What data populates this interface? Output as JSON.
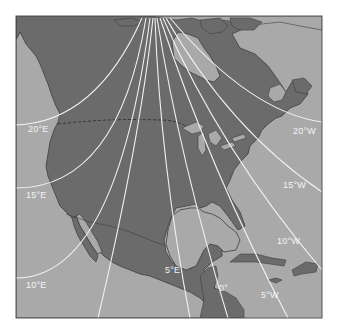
{
  "map": {
    "title": "Magnetic declination isogonic lines — North America",
    "colors": {
      "land": "#6b6b6b",
      "water": "#a9a9a9",
      "isogonic_line": "#f2f2f2",
      "coastline": "#3e3e3e",
      "border_dashed": "#2e2e2e",
      "frame": "#555555",
      "label": "#f4f4f4"
    },
    "labels": [
      {
        "id": "20E",
        "text": "20°E",
        "x": 28,
        "y": 124
      },
      {
        "id": "15E",
        "text": "15°E",
        "x": 26,
        "y": 189
      },
      {
        "id": "10E",
        "text": "10°E",
        "x": 26,
        "y": 282
      },
      {
        "id": "5E",
        "text": "5°E",
        "x": 165,
        "y": 265
      },
      {
        "id": "0",
        "text": "0°",
        "x": 219,
        "y": 283
      },
      {
        "id": "5W",
        "text": "5°W",
        "x": 261,
        "y": 289
      },
      {
        "id": "10W",
        "text": "10°W",
        "x": 277,
        "y": 236
      },
      {
        "id": "15W",
        "text": "15°W",
        "x": 283,
        "y": 181
      },
      {
        "id": "20W",
        "text": "20°W",
        "x": 293,
        "y": 127
      }
    ],
    "features": {
      "regions": [
        "Alaska",
        "Canada",
        "United States",
        "Mexico",
        "Greenland",
        "Cuba",
        "Hispaniola",
        "Jamaica",
        "Central America"
      ],
      "water_bodies": [
        "Pacific Ocean",
        "Atlantic Ocean",
        "Gulf of Mexico",
        "Hudson Bay",
        "Gulf of California",
        "Great Lakes"
      ]
    }
  }
}
